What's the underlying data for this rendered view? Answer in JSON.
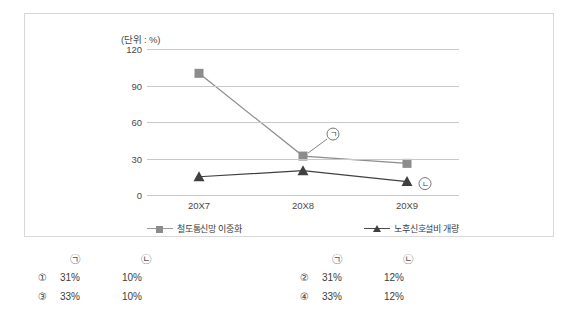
{
  "chart_data": {
    "type": "line",
    "title": "",
    "unit_label": "(단위 : %)",
    "xlabel": "",
    "ylabel": "",
    "categories": [
      "20X7",
      "20X8",
      "20X9"
    ],
    "yticks": [
      120,
      90,
      60,
      30,
      0
    ],
    "ylim": [
      0,
      120
    ],
    "grid": true,
    "legend_position": "bottom",
    "series": [
      {
        "name": "철도통신망 이중화",
        "marker": "square",
        "color": "#8c8c8c",
        "values": [
          100,
          32,
          26
        ]
      },
      {
        "name": "노후신호설비 개량",
        "marker": "triangle",
        "color": "#404040",
        "values": [
          15,
          20,
          11
        ]
      }
    ],
    "annotations": [
      {
        "label": "㉠",
        "series": "철도통신망 이중화",
        "category": "20X8"
      },
      {
        "label": "㉡",
        "series": "노후신호설비 개량",
        "category": "20X9"
      }
    ]
  },
  "answers": {
    "headers": {
      "first": "㉠",
      "second": "㉡"
    },
    "left": [
      {
        "num": "①",
        "first": "31%",
        "second": "10%"
      },
      {
        "num": "③",
        "first": "33%",
        "second": "10%"
      }
    ],
    "right": [
      {
        "num": "②",
        "first": "31%",
        "second": "12%"
      },
      {
        "num": "④",
        "first": "33%",
        "second": "12%"
      }
    ]
  }
}
